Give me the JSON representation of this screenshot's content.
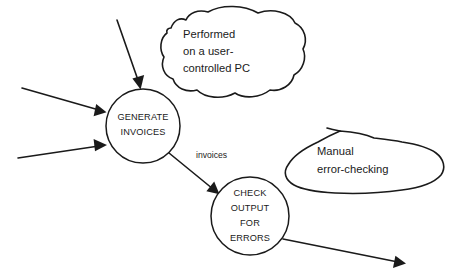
{
  "diagram": {
    "background_color": "#ffffff",
    "line_color": "#1a1a1a",
    "processes": [
      {
        "id": "generate-invoices",
        "lines": [
          "GENERATE",
          "INVOICES"
        ],
        "line1": "GENERATE",
        "line2": "INVOICES",
        "cx": 143,
        "cy": 126,
        "r": 37
      },
      {
        "id": "check-output-for-errors",
        "lines": [
          "CHECK",
          "OUTPUT",
          "FOR",
          "ERRORS"
        ],
        "line1": "CHECK",
        "line2": "OUTPUT",
        "line3": "FOR",
        "line4": "ERRORS",
        "cx": 250,
        "cy": 216,
        "r": 39
      }
    ],
    "flows": [
      {
        "id": "invoices-flow",
        "label": "invoices",
        "from": "generate-invoices",
        "to": "check-output-for-errors"
      },
      {
        "id": "input-flow-top",
        "label": "",
        "from": "external-top",
        "to": "generate-invoices"
      },
      {
        "id": "input-flow-upper-left",
        "label": "",
        "from": "external-upper-left",
        "to": "generate-invoices"
      },
      {
        "id": "input-flow-lower-left",
        "label": "",
        "from": "external-lower-left",
        "to": "generate-invoices"
      },
      {
        "id": "output-flow-right",
        "label": "",
        "from": "check-output-for-errors",
        "to": "external-right"
      }
    ],
    "annotations": [
      {
        "id": "annotation-performed-on-pc",
        "line1": "Performed",
        "line2": "on a user-",
        "line3": "controlled PC",
        "attached_to": "generate-invoices"
      },
      {
        "id": "annotation-manual-error-checking",
        "line1": "Manual",
        "line2": "error-checking",
        "attached_to": "check-output-for-errors"
      }
    ]
  }
}
